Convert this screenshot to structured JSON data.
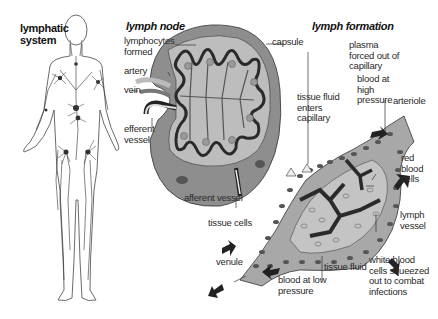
{
  "panels": {
    "lymphatic_system": {
      "title": "lymphatic\nsystem"
    },
    "lymph_node": {
      "title": "lymph node",
      "labels": {
        "lymphocytes": "lymphocytes\nformed",
        "artery": "artery",
        "vein": "vein",
        "efferent": "efferent\nvessel",
        "afferent": "afferent vessel",
        "capsule": "capsule"
      }
    },
    "lymph_formation": {
      "title": "lymph formation",
      "labels": {
        "plasma": "plasma\nforced out of\ncapillary",
        "blood_high": "blood at\nhigh\npressure",
        "tissue_fluid_enters": "tissue fluid\nenters\ncapillary",
        "arteriole": "arteriole",
        "red_blood_cells": "red\nblood\ncells",
        "lymph_vessel": "lymph\nvessel",
        "tissue_cells": "tissue cells",
        "venule": "venule",
        "tissue_fluid": "tissue fluid",
        "blood_low": "blood at low\npressure",
        "white_blood_cells": "white blood\ncells squeezed\nout to combat\ninfections"
      }
    }
  },
  "colors": {
    "background": "#ffffff",
    "node_outer": "#8a8a8a",
    "node_inner": "#b8b8b8",
    "node_dark": "#3a3a3a",
    "tissue_fill": "#a9a9a9",
    "cell_dark": "#4a4a4a",
    "line": "#333333"
  }
}
